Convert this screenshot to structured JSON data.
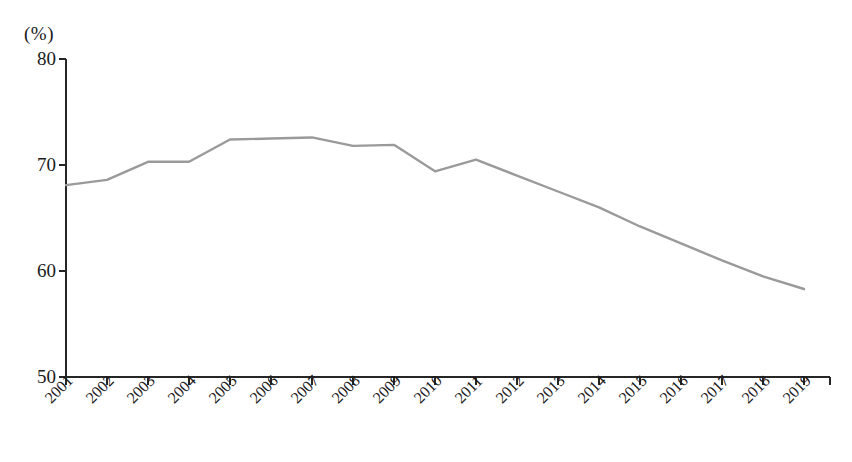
{
  "chart_data": {
    "type": "line",
    "title": "",
    "subtitle": "",
    "xlabel": "",
    "ylabel": "",
    "unit_label": "(%)",
    "categories": [
      "2001",
      "2002",
      "2003",
      "2004",
      "2005",
      "2006",
      "2007",
      "2008",
      "2009",
      "2010",
      "2011",
      "2012",
      "2013",
      "2014",
      "2015",
      "2016",
      "2017",
      "2018",
      "2019"
    ],
    "values": [
      68.1,
      68.6,
      70.3,
      70.3,
      72.4,
      72.5,
      72.6,
      71.8,
      71.9,
      69.4,
      70.5,
      69.0,
      67.5,
      66.0,
      64.2,
      62.6,
      61.0,
      59.5,
      58.3
    ],
    "series": [
      {
        "name": "",
        "values": [
          68.1,
          68.6,
          70.3,
          70.3,
          72.4,
          72.5,
          72.6,
          71.8,
          71.9,
          69.4,
          70.5,
          69.0,
          67.5,
          66.0,
          64.2,
          62.6,
          61.0,
          59.5,
          58.3
        ],
        "color": "#9a9a9a"
      }
    ],
    "ylim": [
      50,
      80
    ],
    "yticks": [
      50,
      60,
      70,
      80
    ],
    "ytick_labels": [
      "50",
      "60",
      "70",
      "80"
    ],
    "xlim": [
      "2001",
      "2019"
    ],
    "grid": false,
    "legend": false,
    "legend_position": "none",
    "line_color": "#9a9a9a",
    "axis_color": "#262626"
  },
  "caption": {
    "text": ""
  }
}
